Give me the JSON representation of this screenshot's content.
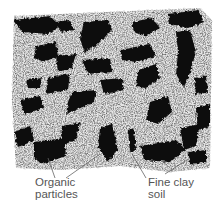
{
  "diagram": {
    "colors": {
      "background": "#ffffff",
      "fine_soil": "#d9d9d9",
      "organic_particles": "#111111",
      "label_text": "#555555",
      "leader_line": "#666666"
    },
    "labels": [
      {
        "id": "organic",
        "lines": [
          "Organic",
          "particles"
        ]
      },
      {
        "id": "clay",
        "lines": [
          "Fine clay",
          "soil"
        ]
      }
    ]
  }
}
